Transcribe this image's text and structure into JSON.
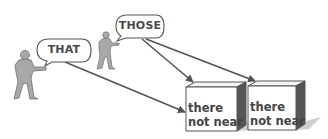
{
  "diagram": {
    "speakers": [
      {
        "id": "near-speaker",
        "bubble_label": "THAT"
      },
      {
        "id": "far-speaker",
        "bubble_label": "THOSE"
      }
    ],
    "boxes": [
      {
        "line1": "there",
        "line2": "not near"
      },
      {
        "line1": "there",
        "line2": "not near"
      }
    ],
    "arrows": [
      {
        "from": "THAT",
        "to": "box-1"
      },
      {
        "from": "THOSE",
        "to": "box-1"
      },
      {
        "from": "THOSE",
        "to": "box-2"
      }
    ],
    "colors": {
      "figure_fill": "#a8a8a8",
      "figure_stroke": "#6e6e6e",
      "arrow": "#555555",
      "bubble_stroke": "#555555",
      "box_front": "#ffffff",
      "box_side": "#555555",
      "box_top": "#f4f4f4",
      "shadow": "#c8c8c8"
    }
  }
}
